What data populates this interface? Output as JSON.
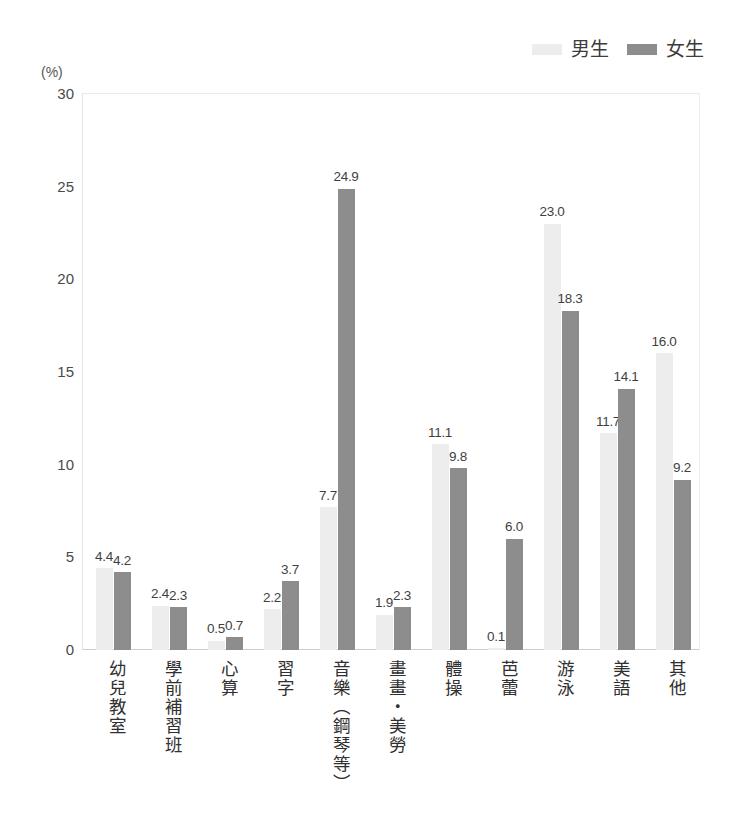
{
  "title_strip": "",
  "axis_unit": "(%)",
  "legend": {
    "position": "top-right",
    "items": [
      {
        "label": "男生",
        "color": "#ededed",
        "swatch_name": "legend-swatch-boys"
      },
      {
        "label": "女生",
        "color": "#8d8d8d",
        "swatch_name": "legend-swatch-girls"
      }
    ]
  },
  "colors": {
    "boys": "#ededed",
    "girls": "#8d8d8d",
    "axis": "#cfcfcf",
    "text": "#3f3f3f"
  },
  "chart_data": {
    "type": "bar",
    "title": "",
    "subtitle": "",
    "xlabel": "",
    "ylabel": "(%)",
    "ylim": [
      0,
      30
    ],
    "yticks": [
      "0",
      "5",
      "10",
      "15",
      "20",
      "25",
      "30"
    ],
    "grid": false,
    "legend_position": "top-right",
    "categories": [
      "幼兒教室",
      "學前補習班",
      "心算",
      "習字",
      "音樂（鋼琴等）",
      "畫畫・美勞",
      "體操",
      "芭蕾",
      "游泳",
      "美語",
      "其他"
    ],
    "series": [
      {
        "name": "男生",
        "color": "#ededed",
        "values": [
          4.4,
          2.4,
          0.5,
          2.2,
          7.7,
          1.9,
          11.1,
          0.1,
          23.0,
          11.7,
          16.0
        ],
        "labels": [
          "4.4",
          "2.4",
          "0.5",
          "2.2",
          "7.7",
          "1.9",
          "11.1",
          "0.1",
          "23.0",
          "11.7",
          "16.0"
        ]
      },
      {
        "name": "女生",
        "color": "#8d8d8d",
        "values": [
          4.2,
          2.3,
          0.7,
          3.7,
          24.9,
          2.3,
          9.8,
          6.0,
          18.3,
          14.1,
          9.2
        ],
        "labels": [
          "4.2",
          "2.3",
          "0.7",
          "3.7",
          "24.9",
          "2.3",
          "9.8",
          "6.0",
          "18.3",
          "14.1",
          "9.2"
        ]
      }
    ]
  }
}
